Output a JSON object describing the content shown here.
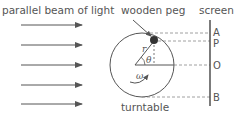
{
  "labels": {
    "beam": "parallel beam of light",
    "peg": "wooden peg",
    "screen": "screen",
    "turntable": "turntable",
    "radius": "r",
    "angle": "θ",
    "angular_velocity": "ω"
  },
  "screen_points": [
    "A",
    "P",
    "O",
    "B"
  ],
  "colors": {
    "line": "#555555",
    "dash": "#888888",
    "peg": "#333333"
  }
}
